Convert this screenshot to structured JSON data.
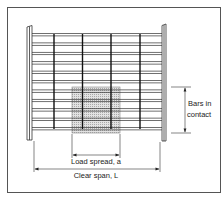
{
  "diagram": {
    "type": "grating-load-spread",
    "labels": {
      "bars_in_contact_line1": "Bars in",
      "bars_in_contact_line2": "contact",
      "load_spread": "Load spread, a",
      "clear_span": "Clear span, L"
    },
    "colors": {
      "line": "#222222",
      "bar_fill": "#ffffff",
      "load_area": "#d8d8d8",
      "frame": "#555555"
    },
    "bearing_bars_count": 11,
    "cross_bars_count": 4
  }
}
